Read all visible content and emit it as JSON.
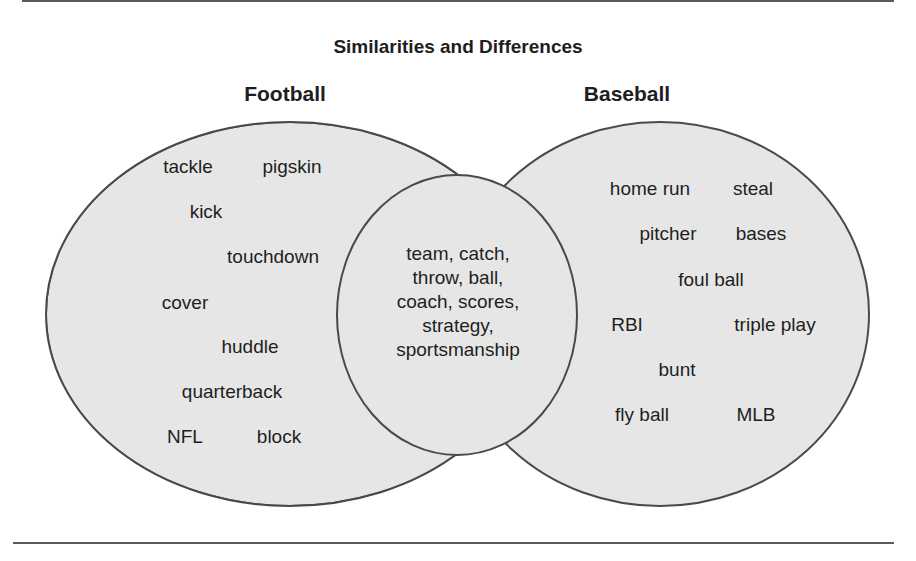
{
  "title": "Similarities and Differences",
  "colors": {
    "fill": "#e6e6e6",
    "stroke": "#4a4a4a",
    "text": "#1e1e1e",
    "rule": "#5a5a5a"
  },
  "sets": {
    "left": {
      "label": "Football",
      "terms": [
        {
          "text": "tackle",
          "x": 188,
          "y": 168
        },
        {
          "text": "pigskin",
          "x": 292,
          "y": 168
        },
        {
          "text": "kick",
          "x": 206,
          "y": 213
        },
        {
          "text": "touchdown",
          "x": 273,
          "y": 258
        },
        {
          "text": "cover",
          "x": 185,
          "y": 304
        },
        {
          "text": "huddle",
          "x": 250,
          "y": 348
        },
        {
          "text": "quarterback",
          "x": 232,
          "y": 393
        },
        {
          "text": "NFL",
          "x": 185,
          "y": 438
        },
        {
          "text": "block",
          "x": 279,
          "y": 438
        }
      ]
    },
    "right": {
      "label": "Baseball",
      "terms": [
        {
          "text": "home run",
          "x": 650,
          "y": 190
        },
        {
          "text": "steal",
          "x": 753,
          "y": 190
        },
        {
          "text": "pitcher",
          "x": 668,
          "y": 235
        },
        {
          "text": "bases",
          "x": 761,
          "y": 235
        },
        {
          "text": "foul ball",
          "x": 711,
          "y": 281
        },
        {
          "text": "RBI",
          "x": 627,
          "y": 326
        },
        {
          "text": "triple play",
          "x": 775,
          "y": 326
        },
        {
          "text": "bunt",
          "x": 677,
          "y": 371
        },
        {
          "text": "fly ball",
          "x": 642,
          "y": 416
        },
        {
          "text": "MLB",
          "x": 756,
          "y": 416
        }
      ]
    },
    "intersection": {
      "lines": [
        "team, catch,",
        "throw, ball,",
        "coach, scores,",
        "strategy,",
        "sportsmanship"
      ]
    }
  }
}
